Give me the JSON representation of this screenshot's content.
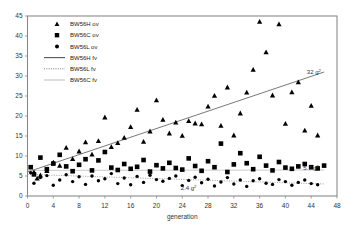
{
  "chart_data": {
    "type": "scatter",
    "title": "",
    "xlabel": "generation",
    "ylabel": "",
    "xlim": [
      0,
      48
    ],
    "ylim": [
      0,
      45
    ],
    "xticks": [
      0,
      4,
      8,
      12,
      16,
      20,
      24,
      28,
      32,
      36,
      40,
      44,
      48
    ],
    "yticks": [
      0,
      5,
      10,
      15,
      20,
      25,
      30,
      35,
      40,
      45
    ],
    "grid": false,
    "legend_position": "top-left",
    "legend": [
      {
        "label": "BW56H ov",
        "marker": "triangle",
        "color": "#000000"
      },
      {
        "label": "BW56C ov",
        "marker": "square",
        "color": "#000000"
      },
      {
        "label": "BW56L ov",
        "marker": "circle",
        "color": "#000000"
      },
      {
        "label": "BW56H fv",
        "marker": "solid-line",
        "color": "#555555"
      },
      {
        "label": "BW56L fv",
        "marker": "dotted-line",
        "color": "#777777"
      },
      {
        "label": "BW56C fv",
        "marker": "thin-line",
        "color": "#aaaaaa"
      }
    ],
    "annotations": [
      {
        "text": "32 g",
        "sup": "2",
        "x": 45.5,
        "y": 30.4
      },
      {
        "text": "5.7 g",
        "sup": "2",
        "x": 45.2,
        "y": 6.6
      },
      {
        "text": "2.4 g",
        "sup": "2",
        "x": 26.2,
        "y": 1.5
      }
    ],
    "series": [
      {
        "name": "BW56H ov",
        "marker": "triangle",
        "points": [
          [
            1,
            6.0
          ],
          [
            1.5,
            4.4
          ],
          [
            2,
            5.2
          ],
          [
            3,
            6.3
          ],
          [
            4,
            8.4
          ],
          [
            5,
            7.6
          ],
          [
            6,
            12.1
          ],
          [
            7,
            9.3
          ],
          [
            8,
            11.2
          ],
          [
            9,
            13.5
          ],
          [
            10,
            10.4
          ],
          [
            11,
            13.8
          ],
          [
            12,
            19.7
          ],
          [
            13,
            12.3
          ],
          [
            14,
            13.3
          ],
          [
            15,
            14.6
          ],
          [
            16,
            17.3
          ],
          [
            17,
            21.6
          ],
          [
            18,
            13.6
          ],
          [
            19,
            16.2
          ],
          [
            20,
            24.0
          ],
          [
            21,
            19.1
          ],
          [
            22,
            15.7
          ],
          [
            23,
            18.4
          ],
          [
            24,
            15.1
          ],
          [
            25,
            18.8
          ],
          [
            26,
            18.2
          ],
          [
            27,
            18.0
          ],
          [
            28,
            22.4
          ],
          [
            29,
            25.1
          ],
          [
            30,
            17.6
          ],
          [
            31,
            27.2
          ],
          [
            32,
            15.2
          ],
          [
            33,
            20.7
          ],
          [
            34,
            25.9
          ],
          [
            35,
            31.6
          ],
          [
            36,
            43.6
          ],
          [
            37,
            36.0
          ],
          [
            38,
            25.2
          ],
          [
            39,
            43.0
          ],
          [
            40,
            18.1
          ],
          [
            41,
            26.0
          ],
          [
            42,
            28.5
          ],
          [
            43,
            16.4
          ],
          [
            44,
            22.6
          ],
          [
            45,
            15.2
          ]
        ]
      },
      {
        "name": "BW56C ov",
        "marker": "square",
        "points": [
          [
            0.5,
            7.2
          ],
          [
            1,
            5.4
          ],
          [
            2,
            9.6
          ],
          [
            3,
            6.7
          ],
          [
            4,
            8.1
          ],
          [
            5,
            10.3
          ],
          [
            6,
            7.4
          ],
          [
            7,
            6.2
          ],
          [
            8,
            7.8
          ],
          [
            9,
            9.2
          ],
          [
            10,
            6.4
          ],
          [
            11,
            8.9
          ],
          [
            12,
            11.0
          ],
          [
            13,
            7.1
          ],
          [
            14,
            6.5
          ],
          [
            15,
            8.0
          ],
          [
            16,
            6.8
          ],
          [
            17,
            7.3
          ],
          [
            18,
            9.0
          ],
          [
            19,
            6.1
          ],
          [
            20,
            7.7
          ],
          [
            21,
            6.9
          ],
          [
            22,
            8.3
          ],
          [
            23,
            7.0
          ],
          [
            24,
            6.6
          ],
          [
            25,
            9.4
          ],
          [
            26,
            7.5
          ],
          [
            27,
            6.3
          ],
          [
            28,
            8.7
          ],
          [
            29,
            7.2
          ],
          [
            30,
            13.1
          ],
          [
            31,
            6.0
          ],
          [
            32,
            7.9
          ],
          [
            33,
            10.7
          ],
          [
            34,
            8.2
          ],
          [
            35,
            6.7
          ],
          [
            36,
            9.8
          ],
          [
            37,
            7.6
          ],
          [
            38,
            6.4
          ],
          [
            39,
            8.5
          ],
          [
            40,
            7.1
          ],
          [
            41,
            6.8
          ],
          [
            42,
            7.4
          ],
          [
            43,
            8.0
          ],
          [
            44,
            7.2
          ],
          [
            45,
            6.9
          ],
          [
            46,
            7.6
          ]
        ]
      },
      {
        "name": "BW56L ov",
        "marker": "circle",
        "points": [
          [
            0.5,
            5.8
          ],
          [
            1,
            3.2
          ],
          [
            2,
            4.6
          ],
          [
            3,
            5.1
          ],
          [
            4,
            2.7
          ],
          [
            5,
            4.0
          ],
          [
            6,
            5.3
          ],
          [
            7,
            3.6
          ],
          [
            8,
            4.8
          ],
          [
            9,
            2.9
          ],
          [
            10,
            5.0
          ],
          [
            11,
            3.8
          ],
          [
            12,
            4.3
          ],
          [
            13,
            5.6
          ],
          [
            14,
            3.1
          ],
          [
            15,
            4.5
          ],
          [
            16,
            2.8
          ],
          [
            17,
            4.9
          ],
          [
            18,
            3.4
          ],
          [
            19,
            5.2
          ],
          [
            20,
            4.1
          ],
          [
            21,
            3.7
          ],
          [
            22,
            4.4
          ],
          [
            23,
            5.0
          ],
          [
            24,
            2.6
          ],
          [
            25,
            3.9
          ],
          [
            26,
            4.7
          ],
          [
            27,
            3.3
          ],
          [
            28,
            4.2
          ],
          [
            29,
            2.5
          ],
          [
            30,
            3.5
          ],
          [
            31,
            4.6
          ],
          [
            32,
            3.0
          ],
          [
            33,
            4.0
          ],
          [
            34,
            2.4
          ],
          [
            35,
            3.8
          ],
          [
            36,
            4.3
          ],
          [
            37,
            3.2
          ],
          [
            38,
            2.9
          ],
          [
            39,
            4.1
          ],
          [
            40,
            3.6
          ],
          [
            41,
            2.7
          ],
          [
            42,
            3.4
          ],
          [
            43,
            4.0
          ],
          [
            44,
            3.1
          ],
          [
            45,
            2.8
          ]
        ]
      }
    ],
    "fits": [
      {
        "name": "BW56H fv",
        "style": "solid",
        "x0": 0,
        "y0": 6.0,
        "x1": 46,
        "y1": 31.0
      },
      {
        "name": "BW56L fv",
        "style": "dotted",
        "x0": 0,
        "y0": 5.4,
        "x1": 46,
        "y1": 3.0
      },
      {
        "name": "BW56C fv",
        "style": "thin",
        "x0": 0,
        "y0": 6.4,
        "x1": 46,
        "y1": 6.5
      }
    ]
  }
}
